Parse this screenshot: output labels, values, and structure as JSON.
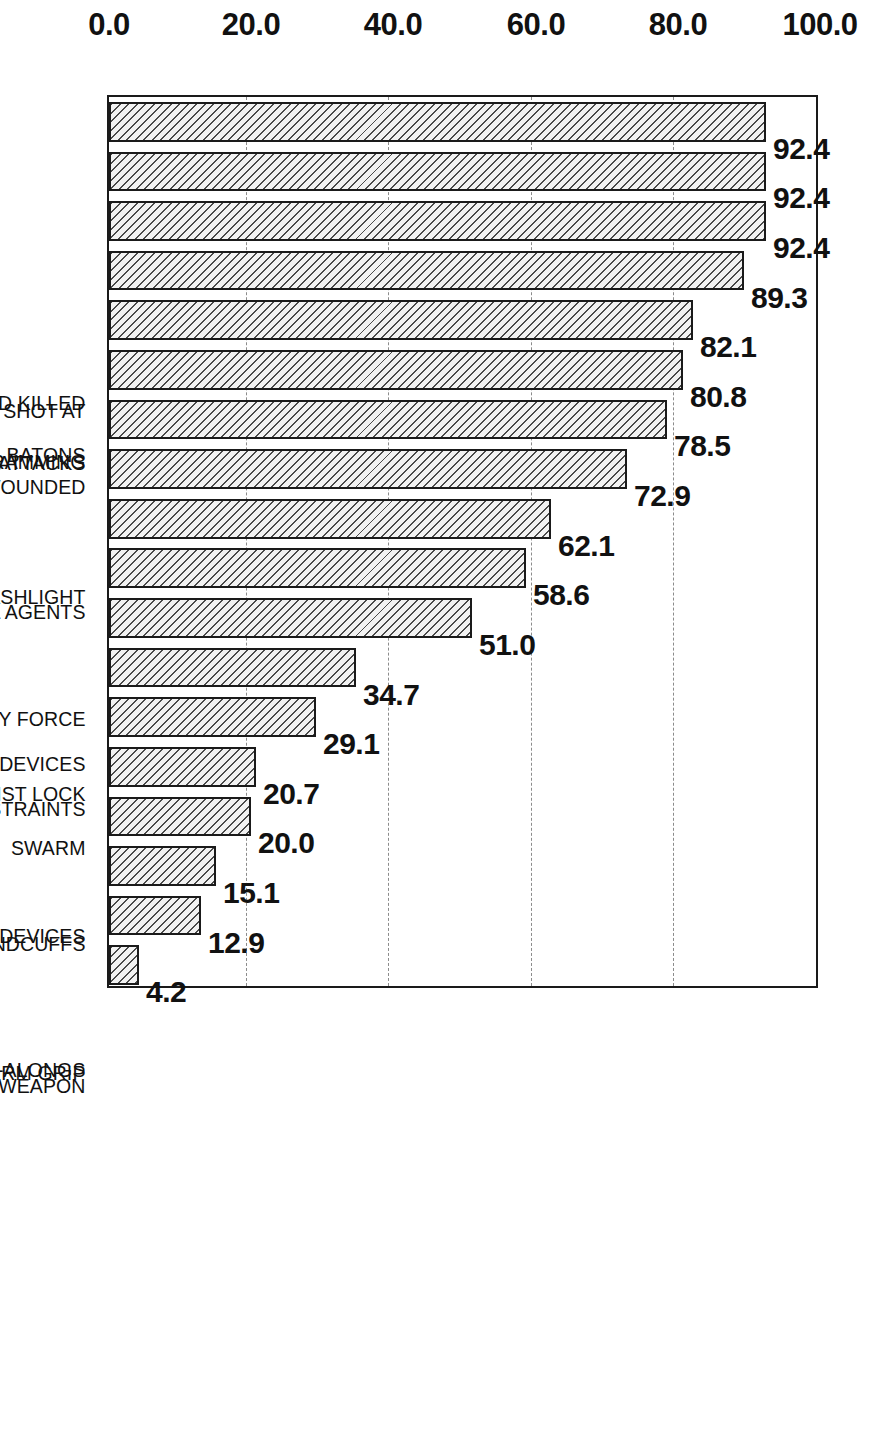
{
  "chart_data": {
    "type": "bar",
    "orientation": "vertical-rotated",
    "title": "",
    "xlabel": "",
    "ylabel": "Percent Mandating Reporting",
    "ylim": [
      0.0,
      100.0
    ],
    "yticks": [
      "0.0",
      "20.0",
      "40.0",
      "60.0",
      "80.0",
      "100.0"
    ],
    "ytick_values": [
      0.0,
      20.0,
      40.0,
      60.0,
      80.0,
      100.0
    ],
    "grid": "dashed horizontal gridlines at 20.0, 40.0, 60.0, 80.0",
    "legend": "none",
    "bar_style": "diagonal-hatch",
    "categories": [
      "CIVILIANS SHOT AND KILLED",
      "CIVILIANS SHOT AND WOUNDED",
      "CIVILIANS SHOT AT",
      "VEHICLE RAMMING",
      "DOG ATTACKS",
      "BATONS",
      "CHEMICAL AGENTS",
      "FLASHLIGHT",
      "OTHER IMPACT DEVICES",
      "BODILY FORCE",
      "NECK RESTRAINTS",
      "TWIST LOCK",
      "ELECTRICAL DEVICES",
      "SWARM",
      "HANDCUFFS",
      "UNHOLSTER WEAPON",
      "COME-ALONGS",
      "FIRM GRIP"
    ],
    "values": [
      92.4,
      92.4,
      92.4,
      89.3,
      82.1,
      80.8,
      78.5,
      72.9,
      62.1,
      58.6,
      51.0,
      34.7,
      29.1,
      20.7,
      20.0,
      15.1,
      12.9,
      4.2
    ],
    "value_labels": [
      "92.4",
      "92.4",
      "92.4",
      "89.3",
      "82.1",
      "80.8",
      "78.5",
      "72.9",
      "62.1",
      "58.6",
      "51.0",
      "34.7",
      "29.1",
      "20.7",
      "20.0",
      "15.1",
      "12.9",
      "4.2"
    ]
  },
  "colors": {
    "axis": "#1a1a1a",
    "grid": "#8c8c8c",
    "bar_fill": "#f2f2f2",
    "bar_hatch": "#4a4a4a",
    "text": "#111111",
    "background": "#ffffff"
  }
}
